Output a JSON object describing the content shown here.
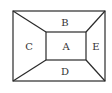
{
  "diagram": {
    "stroke_color": "#2a2a2a",
    "outer_rect": {
      "x1": 13,
      "y1": 11,
      "x2": 105,
      "y2": 81
    },
    "inner_rect": {
      "x1": 46,
      "y1": 32,
      "x2": 86,
      "y2": 60
    },
    "regions": [
      {
        "id": "A",
        "label": "A",
        "position": "center"
      },
      {
        "id": "B",
        "label": "B",
        "position": "top"
      },
      {
        "id": "C",
        "label": "C",
        "position": "left"
      },
      {
        "id": "D",
        "label": "D",
        "position": "bottom"
      },
      {
        "id": "E",
        "label": "E",
        "position": "right"
      }
    ]
  }
}
